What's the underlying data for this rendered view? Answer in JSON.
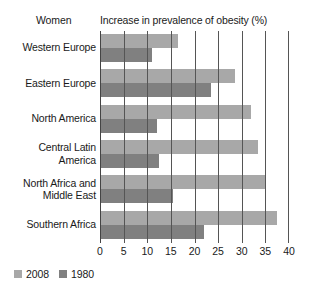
{
  "header": {
    "series_group_label": "Women",
    "title": "Increase in prevalence of obesity (%)"
  },
  "legend": {
    "items": [
      {
        "label": "2008",
        "color": "#a8a8a8"
      },
      {
        "label": "1980",
        "color": "#808080"
      }
    ]
  },
  "axis": {
    "ticks": [
      "0",
      "5",
      "10",
      "15",
      "20",
      "25",
      "30",
      "35",
      "40"
    ]
  },
  "categories": [
    "Western Europe",
    "Eastern Europe",
    "North America",
    "Central Latin\nAmerica",
    "North Africa and\nMiddle East",
    "Southern Africa"
  ],
  "chart_data": {
    "type": "bar",
    "orientation": "horizontal",
    "title": "Increase in prevalence of obesity (%)",
    "group_label": "Women",
    "xlabel": "Increase in prevalence of obesity (%)",
    "ylabel": "",
    "xlim": [
      0,
      40
    ],
    "xticks": [
      0,
      5,
      10,
      15,
      20,
      25,
      30,
      35,
      40
    ],
    "grid": "vertical",
    "legend_position": "bottom-left",
    "categories": [
      "Western Europe",
      "Eastern Europe",
      "North America",
      "Central Latin America",
      "North Africa and Middle East",
      "Southern Africa"
    ],
    "series": [
      {
        "name": "2008",
        "color": "#a8a8a8",
        "values": [
          16.5,
          28.5,
          32,
          33.5,
          35,
          37.5
        ]
      },
      {
        "name": "1980",
        "color": "#808080",
        "values": [
          11,
          23.5,
          12,
          12.5,
          15.5,
          22
        ]
      }
    ]
  }
}
